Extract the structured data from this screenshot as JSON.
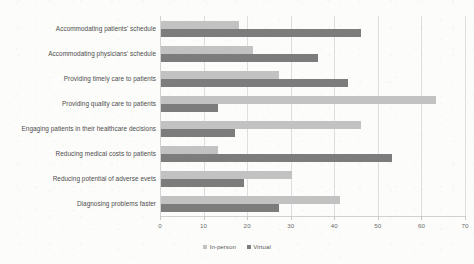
{
  "chart_data": {
    "type": "bar",
    "orientation": "horizontal",
    "title": "",
    "subtitle": "",
    "xlabel": "",
    "ylabel": "",
    "xlim": [
      0,
      70
    ],
    "xticks": [
      0,
      10,
      20,
      30,
      40,
      50,
      60,
      70
    ],
    "grid": true,
    "legend_position": "bottom",
    "categories": [
      "Accommodating patients' schedule",
      "Accommodating physicians' schedule",
      "Providing timely care to patients",
      "Providing quality care to patients",
      "Engaging patients in their healthcare decisions",
      "Reducing medical costs to patients",
      "Reducing potential of adverse evets",
      "Diagnosing problems faster"
    ],
    "series": [
      {
        "name": "In-person",
        "color": "#c2c2c2",
        "values": [
          18,
          21,
          27,
          63,
          46,
          13,
          30,
          41
        ]
      },
      {
        "name": "Virtual",
        "color": "#7c7c7c",
        "values": [
          46,
          36,
          43,
          13,
          17,
          53,
          19,
          27
        ]
      }
    ]
  },
  "legend": {
    "items": [
      {
        "label": "In-person",
        "swatch": "legend-swatch-in-person"
      },
      {
        "label": "Virtual",
        "swatch": "legend-swatch-virtual"
      }
    ]
  },
  "axis": {
    "tick_labels": [
      "0",
      "10",
      "20",
      "30",
      "40",
      "50",
      "60",
      "70"
    ]
  },
  "colors": {
    "background": "#fcfcfa",
    "in_person_bar": "#c2c2c2",
    "virtual_bar": "#7c7c7c",
    "gridline": "#dedede",
    "axis_text": "#6d6d6d",
    "category_text": "#4d4d4d"
  }
}
